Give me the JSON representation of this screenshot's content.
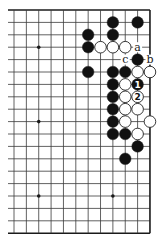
{
  "diagram": {
    "type": "go-board-fragment",
    "grid": {
      "columns": 12,
      "rows": 19,
      "origin_x": 14,
      "origin_y": 10,
      "spacing_x": 12.36,
      "spacing_y": 12.4,
      "left_extension_x": 8,
      "edges": [
        "top",
        "right",
        "bottom"
      ]
    },
    "star_points": [
      {
        "col": 2,
        "row": 3
      },
      {
        "col": 2,
        "row": 9
      },
      {
        "col": 2,
        "row": 15
      },
      {
        "col": 8,
        "row": 15
      }
    ],
    "stones": [
      {
        "col": 8,
        "row": 1,
        "color": "black"
      },
      {
        "col": 10,
        "row": 1,
        "color": "black"
      },
      {
        "col": 6,
        "row": 2,
        "color": "black"
      },
      {
        "col": 8,
        "row": 2,
        "color": "black"
      },
      {
        "col": 6,
        "row": 3,
        "color": "black"
      },
      {
        "col": 7,
        "row": 3,
        "color": "white"
      },
      {
        "col": 8,
        "row": 3,
        "color": "white"
      },
      {
        "col": 9,
        "row": 3,
        "color": "white"
      },
      {
        "col": 10,
        "row": 4,
        "color": "black"
      },
      {
        "col": 6,
        "row": 5,
        "color": "black"
      },
      {
        "col": 8,
        "row": 5,
        "color": "black"
      },
      {
        "col": 9,
        "row": 5,
        "color": "black"
      },
      {
        "col": 10,
        "row": 5,
        "color": "white"
      },
      {
        "col": 11,
        "row": 5,
        "color": "white"
      },
      {
        "col": 8,
        "row": 6,
        "color": "black"
      },
      {
        "col": 9,
        "row": 6,
        "color": "white"
      },
      {
        "col": 10,
        "row": 6,
        "color": "black",
        "label": "1"
      },
      {
        "col": 8,
        "row": 7,
        "color": "black"
      },
      {
        "col": 9,
        "row": 7,
        "color": "white"
      },
      {
        "col": 10,
        "row": 7,
        "color": "white",
        "label": "2"
      },
      {
        "col": 8,
        "row": 8,
        "color": "black"
      },
      {
        "col": 9,
        "row": 8,
        "color": "white"
      },
      {
        "col": 10,
        "row": 8,
        "color": "white"
      },
      {
        "col": 8,
        "row": 9,
        "color": "black"
      },
      {
        "col": 9,
        "row": 9,
        "color": "white"
      },
      {
        "col": 11,
        "row": 9,
        "color": "white"
      },
      {
        "col": 8,
        "row": 10,
        "color": "black"
      },
      {
        "col": 9,
        "row": 10,
        "color": "black"
      },
      {
        "col": 10,
        "row": 10,
        "color": "white"
      },
      {
        "col": 10,
        "row": 11,
        "color": "black"
      },
      {
        "col": 9,
        "row": 12,
        "color": "black"
      }
    ],
    "point_labels": [
      {
        "col": 10,
        "row": 3,
        "text": "a"
      },
      {
        "col": 11,
        "row": 4,
        "text": "b"
      },
      {
        "col": 9,
        "row": 4,
        "text": "c"
      }
    ],
    "colors": {
      "line": "#3a3a3a",
      "edge": "#1a1a1a",
      "black_stone": "#111111",
      "white_stone": "#ffffff",
      "stone_outline": "#222222",
      "background": "#ffffff"
    }
  }
}
